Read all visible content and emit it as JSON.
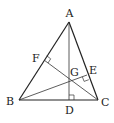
{
  "diagram": {
    "type": "triangle-orthocenter",
    "points": {
      "A": {
        "label": "A",
        "x": 69,
        "y": 22
      },
      "B": {
        "label": "B",
        "x": 19,
        "y": 100
      },
      "C": {
        "label": "C",
        "x": 98,
        "y": 100
      },
      "D": {
        "label": "D",
        "x": 69,
        "y": 100
      },
      "E": {
        "label": "E",
        "x": 87,
        "y": 75
      },
      "F": {
        "label": "F",
        "x": 44,
        "y": 60
      },
      "G": {
        "label": "G",
        "x": 69,
        "y": 80
      }
    },
    "segments": [
      "AB",
      "AC",
      "BC",
      "AD",
      "BE",
      "CF"
    ],
    "right_angles": [
      "D",
      "E",
      "F"
    ]
  }
}
